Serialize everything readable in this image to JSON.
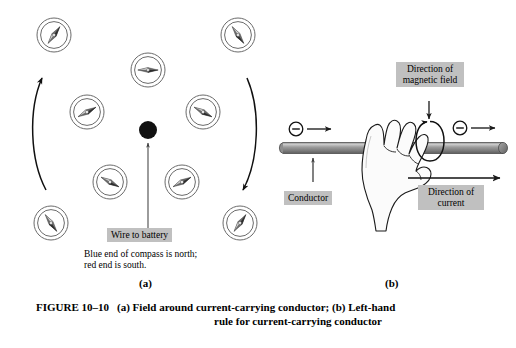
{
  "figure": {
    "number": "FIGURE 10–10",
    "caption_line1": "(a) Field around current-carrying conductor; (b) Left-hand",
    "caption_line2": "rule for current-carrying conductor",
    "panel_a_letter": "(a)",
    "panel_b_letter": "(b)"
  },
  "panel_a": {
    "title": "Field around current-carrying conductor",
    "wire_label": "Wire to battery",
    "note_line1": "Blue end of compass is north;",
    "note_line2": "red end is south.",
    "wire_dot": {
      "cx": 148,
      "cy": 130,
      "r": 9,
      "color": "#111111"
    },
    "pointer_arrow": {
      "x": 148,
      "y_from": 232,
      "y_to": 143
    },
    "compasses": [
      {
        "id": "compass-top-left",
        "cx": 54,
        "cy": 35,
        "r": 17,
        "needle_angle": -55
      },
      {
        "id": "compass-top-center",
        "cx": 148,
        "cy": 70,
        "r": 17,
        "needle_angle": 0
      },
      {
        "id": "compass-top-right",
        "cx": 238,
        "cy": 35,
        "r": 17,
        "needle_angle": 55
      },
      {
        "id": "compass-mid-left",
        "cx": 87,
        "cy": 112,
        "r": 17,
        "needle_angle": -28
      },
      {
        "id": "compass-mid-right",
        "cx": 203,
        "cy": 112,
        "r": 17,
        "needle_angle": 28
      },
      {
        "id": "compass-low-left",
        "cx": 110,
        "cy": 182,
        "r": 17,
        "needle_angle": 28
      },
      {
        "id": "compass-low-right",
        "cx": 182,
        "cy": 182,
        "r": 17,
        "needle_angle": -28
      },
      {
        "id": "compass-bottom-left",
        "cx": 51,
        "cy": 223,
        "r": 17,
        "needle_angle": 55
      },
      {
        "id": "compass-bottom-right",
        "cx": 240,
        "cy": 223,
        "r": 17,
        "needle_angle": -55
      }
    ],
    "field_arcs": [
      {
        "id": "field-arc-left",
        "direction": "up"
      },
      {
        "id": "field-arc-right",
        "direction": "down"
      }
    ]
  },
  "panel_b": {
    "title": "Left-hand rule for current-carrying conductor",
    "conductor_label": "Conductor",
    "magnetic_field_label_line1": "Direction of",
    "magnetic_field_label_line2": "magnetic field",
    "current_label_line1": "Direction of",
    "current_label_line2": "current",
    "electrons": [
      {
        "id": "electron-left",
        "cx": 296,
        "cy": 129,
        "symbol": "−"
      },
      {
        "id": "electron-right",
        "cx": 460,
        "cy": 128,
        "symbol": "−"
      }
    ],
    "conductor": {
      "x1": 283,
      "x2": 505,
      "y": 148,
      "thickness": 11,
      "color_top": "#b9b9b9",
      "color_mid": "#8d8d8d",
      "color_bottom": "#6a6a6a"
    },
    "hand": {
      "fill": "#fbfbfb",
      "stroke": "#1a1a1a"
    },
    "field_loop": {
      "cx": 430,
      "cy": 141,
      "rx": 13,
      "ry": 20
    }
  },
  "colors": {
    "ink": "#000000",
    "label_bg": "#c0c0c0",
    "page_bg": "#ffffff",
    "wire_dot": "#111111",
    "conductor_gray": "#8d8d8d"
  }
}
